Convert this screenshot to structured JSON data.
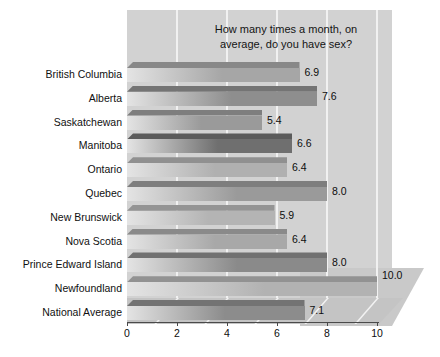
{
  "chart_data": {
    "type": "bar",
    "orientation": "horizontal",
    "title": "How many times a month, on average, do you have sex?",
    "title_line1": "How many times a month, on",
    "title_line2": "average, do you have sex?",
    "xlabel": "",
    "ylabel": "",
    "xlim": [
      0,
      10
    ],
    "xticks": [
      0,
      2,
      4,
      6,
      8,
      10
    ],
    "xtick_labels": [
      "0",
      "2",
      "4",
      "6",
      "8",
      "10"
    ],
    "grid": "vertical-white-gridlines",
    "legend": "none",
    "categories": [
      "British Columbia",
      "Alberta",
      "Saskatchewan",
      "Manitoba",
      "Ontario",
      "Quebec",
      "New Brunswick",
      "Nova Scotia",
      "Prince Edward Island",
      "Newfoundland",
      "National Average"
    ],
    "values": [
      6.9,
      7.6,
      5.4,
      6.6,
      6.4,
      8.0,
      5.9,
      6.4,
      8.0,
      10.0,
      7.1
    ],
    "value_labels": [
      "6.9",
      "7.6",
      "5.4",
      "6.6",
      "6.4",
      "8.0",
      "5.9",
      "6.4",
      "8.0",
      "10.0",
      "7.1"
    ],
    "bar_shades": [
      "#a6a6a6",
      "#8e8e8e",
      "#9a9a9a",
      "#6f6f6f",
      "#b0b0b0",
      "#9a9a9a",
      "#b4b4b4",
      "#a8a8a8",
      "#8a8a8a",
      "#b2b2b2",
      "#8c8c8c"
    ]
  },
  "colors": {
    "page_background": "#ffffff",
    "plot_background": "#d2d2d2",
    "deck_background": "#c9c9c9",
    "floor_background": "#c4c4c4",
    "gridline": "#f1f1f1",
    "axis": "#4a4a4a",
    "text": "#0d0d0d"
  }
}
